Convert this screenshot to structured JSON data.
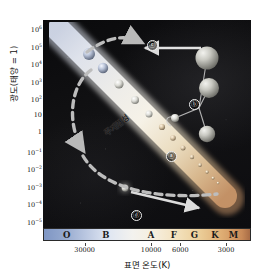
{
  "figure": {
    "type": "hr-diagram",
    "title": "",
    "background_color": "#0c0c0f"
  },
  "axes": {
    "y": {
      "label": "광도(태양 = 1)",
      "ticks": [
        {
          "mantissa": "10",
          "exp": "6"
        },
        {
          "mantissa": "10",
          "exp": "5"
        },
        {
          "mantissa": "10",
          "exp": "4"
        },
        {
          "mantissa": "10",
          "exp": "3"
        },
        {
          "mantissa": "10",
          "exp": "2"
        },
        {
          "mantissa": "10",
          "exp": ""
        },
        {
          "mantissa": "1",
          "exp": ""
        },
        {
          "mantissa": "10",
          "exp": "-1"
        },
        {
          "mantissa": "10",
          "exp": "-2"
        },
        {
          "mantissa": "10",
          "exp": "-3"
        },
        {
          "mantissa": "10",
          "exp": "-4"
        },
        {
          "mantissa": "10",
          "exp": "-5"
        }
      ]
    },
    "x": {
      "label": "표면 온도(K)",
      "spectral_classes": [
        {
          "letter": "O",
          "pos_pct": 11
        },
        {
          "letter": "B",
          "pos_pct": 30
        },
        {
          "letter": "A",
          "pos_pct": 52
        },
        {
          "letter": "F",
          "pos_pct": 63
        },
        {
          "letter": "G",
          "pos_pct": 73
        },
        {
          "letter": "K",
          "pos_pct": 83
        },
        {
          "letter": "M",
          "pos_pct": 92
        }
      ],
      "temperature_ticks": [
        {
          "label": "30000",
          "pos_pct": 20
        },
        {
          "label": "10000",
          "pos_pct": 52
        },
        {
          "label": "6000",
          "pos_pct": 66
        },
        {
          "label": "3000",
          "pos_pct": 88
        }
      ]
    }
  },
  "annotations": {
    "main_sequence_label": "주계열성",
    "markers": [
      {
        "id": "marker-c",
        "label": "ⓒ",
        "x_pct": 50,
        "y_pct": 11
      },
      {
        "id": "marker-b",
        "label": "ⓑ",
        "x_pct": 74,
        "y_pct": 40
      },
      {
        "id": "marker-a",
        "label": "ⓐ",
        "x_pct": 62,
        "y_pct": 65
      },
      {
        "id": "marker-d",
        "label": "ⓓ",
        "x_pct": 45,
        "y_pct": 94
      }
    ]
  },
  "chart_data": {
    "type": "scatter",
    "xlabel": "표면 온도(K)",
    "ylabel": "광도(태양 = 1)",
    "xlim": [
      40000,
      2500
    ],
    "ylim": [
      1e-05,
      1000000.0
    ],
    "x_scale": "log-reversed",
    "y_scale": "log",
    "grid": false,
    "legend": false,
    "series": [
      {
        "name": "주계열성",
        "type": "band",
        "points": [
          {
            "x_pct": 8,
            "y_pct": 4
          },
          {
            "x_pct": 22,
            "y_pct": 18
          },
          {
            "x_pct": 38,
            "y_pct": 34
          },
          {
            "x_pct": 52,
            "y_pct": 50
          },
          {
            "x_pct": 66,
            "y_pct": 64
          },
          {
            "x_pct": 80,
            "y_pct": 78
          },
          {
            "x_pct": 92,
            "y_pct": 88
          }
        ]
      },
      {
        "name": "주계열 별 크기 구슬",
        "type": "spheres",
        "points": [
          {
            "x_pct": 16,
            "y_pct": 11,
            "r": 4.0
          },
          {
            "x_pct": 24,
            "y_pct": 19,
            "r": 3.4
          },
          {
            "x_pct": 32,
            "y_pct": 27,
            "r": 3.0
          },
          {
            "x_pct": 41,
            "y_pct": 36,
            "r": 2.7
          },
          {
            "x_pct": 50,
            "y_pct": 45,
            "r": 2.4
          },
          {
            "x_pct": 58,
            "y_pct": 54,
            "r": 2.1
          },
          {
            "x_pct": 66,
            "y_pct": 62,
            "r": 1.9
          },
          {
            "x_pct": 73,
            "y_pct": 70,
            "r": 1.7
          },
          {
            "x_pct": 79,
            "y_pct": 76,
            "r": 1.5
          },
          {
            "x_pct": 85,
            "y_pct": 82,
            "r": 1.3
          },
          {
            "x_pct": 90,
            "y_pct": 87,
            "r": 1.1
          }
        ]
      },
      {
        "name": "거성/초거성",
        "type": "spheres",
        "points": [
          {
            "x_pct": 80,
            "y_pct": 17,
            "r": 9.5
          },
          {
            "x_pct": 88,
            "y_pct": 33,
            "r": 8.0
          },
          {
            "x_pct": 84,
            "y_pct": 51,
            "r": 6.5
          },
          {
            "x_pct": 70,
            "y_pct": 47,
            "r": 3.0
          }
        ]
      },
      {
        "name": "백색왜성",
        "type": "spheres",
        "points": [
          {
            "x_pct": 44,
            "y_pct": 90,
            "r": 2.2
          }
        ]
      }
    ],
    "arrows": [
      {
        "name": "evolution-to-giant",
        "from_pct": [
          88,
          13
        ],
        "to_pct": [
          52,
          13
        ],
        "style": "solid"
      },
      {
        "name": "main-to-giant-dashed",
        "from_pct": [
          22,
          18
        ],
        "to_pct": [
          48,
          12
        ],
        "style": "dashed"
      },
      {
        "name": "descend-left-dashed",
        "from_pct": [
          28,
          30
        ],
        "to_pct": [
          20,
          68
        ],
        "style": "dashed"
      },
      {
        "name": "to-white-dwarf-dashed",
        "from_pct": [
          22,
          72
        ],
        "to_pct": [
          64,
          92
        ],
        "style": "dashed"
      },
      {
        "name": "giant-to-dwarf",
        "from_pct": [
          46,
          88
        ],
        "to_pct": [
          78,
          96
        ],
        "style": "solid"
      }
    ]
  }
}
